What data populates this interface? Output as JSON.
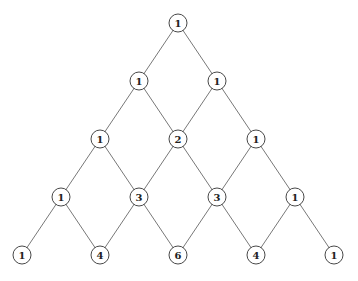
{
  "diagram": {
    "node_radius": 9,
    "rows": [
      [
        1
      ],
      [
        1,
        1
      ],
      [
        1,
        2,
        1
      ],
      [
        1,
        3,
        3,
        1
      ],
      [
        1,
        4,
        6,
        4,
        1
      ]
    ],
    "layout": {
      "top_x": 178,
      "top_y": 23,
      "dx": 39,
      "dy": 58
    },
    "colors": {
      "edge": "#555555",
      "node_stroke": "#333333",
      "node_fill": "#ffffff",
      "text": "#222222"
    }
  }
}
